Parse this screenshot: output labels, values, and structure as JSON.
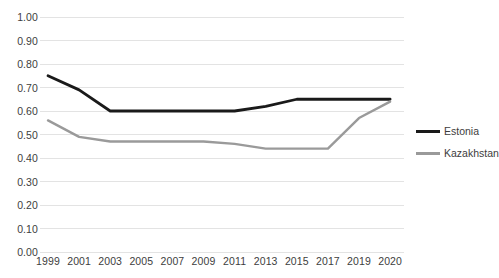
{
  "chart_data": {
    "type": "line",
    "title": "",
    "subtitle": "",
    "xlabel": "",
    "ylabel": "",
    "categories": [
      "1999",
      "2001",
      "2003",
      "2005",
      "2007",
      "2009",
      "2011",
      "2013",
      "2015",
      "2017",
      "2019",
      "2020"
    ],
    "series": [
      {
        "name": "Estonia",
        "color": "#1a1a1a",
        "values": [
          0.75,
          0.69,
          0.6,
          0.6,
          0.6,
          0.6,
          0.6,
          0.62,
          0.65,
          0.65,
          0.65,
          0.65
        ]
      },
      {
        "name": "Kazakhstan",
        "color": "#9a9a9a",
        "values": [
          0.56,
          0.49,
          0.47,
          0.47,
          0.47,
          0.47,
          0.46,
          0.44,
          0.44,
          0.44,
          0.57,
          0.64
        ]
      }
    ],
    "ylim": [
      0.0,
      1.0
    ],
    "ytick_labels": [
      "0.00",
      "0.10",
      "0.20",
      "0.30",
      "0.40",
      "0.50",
      "0.60",
      "0.70",
      "0.80",
      "0.90",
      "1.00"
    ],
    "ytick_values": [
      0.0,
      0.1,
      0.2,
      0.3,
      0.4,
      0.5,
      0.6,
      0.7,
      0.8,
      0.9,
      1.0
    ],
    "grid": {
      "horizontal": true,
      "vertical": false,
      "color": "#e3e3e3"
    },
    "legend": {
      "position": "right",
      "entries": [
        {
          "label": "Estonia",
          "color": "#1a1a1a"
        },
        {
          "label": "Kazakhstan",
          "color": "#9a9a9a"
        }
      ]
    },
    "background": "#ffffff",
    "axis_color": "#d9d9d9"
  }
}
